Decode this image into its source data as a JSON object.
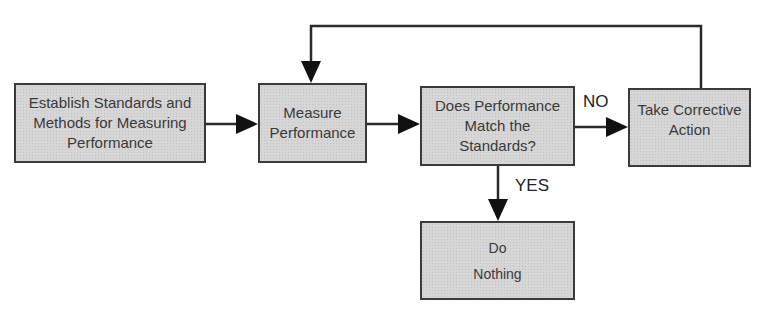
{
  "diagram": {
    "type": "flowchart",
    "nodes": [
      {
        "id": "establish",
        "label": "Establish Standards and\nMethods for Measuring\nPerformance"
      },
      {
        "id": "measure",
        "label": "Measure\nPerformance"
      },
      {
        "id": "decision",
        "label": "Does Performance\nMatch the\nStandards?"
      },
      {
        "id": "corrective",
        "label": "Take Corrective\nAction"
      },
      {
        "id": "nothing",
        "label": "Do\nNothing"
      }
    ],
    "edges": [
      {
        "from": "establish",
        "to": "measure",
        "label": ""
      },
      {
        "from": "measure",
        "to": "decision",
        "label": ""
      },
      {
        "from": "decision",
        "to": "corrective",
        "label": "NO"
      },
      {
        "from": "decision",
        "to": "nothing",
        "label": "YES"
      },
      {
        "from": "corrective",
        "to": "measure",
        "label": ""
      }
    ],
    "edge_labels": {
      "no": "NO",
      "yes": "YES"
    },
    "colors": {
      "box_fill": "#d6d6d6",
      "stroke": "#2a2a2a",
      "text": "#3a3a3a"
    }
  }
}
